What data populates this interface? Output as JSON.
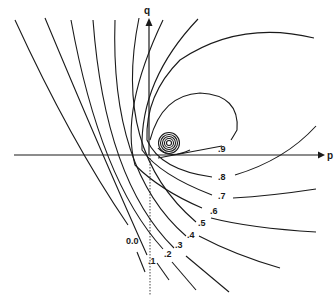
{
  "diagram": {
    "axes": {
      "x_label": "p",
      "y_label": "q"
    },
    "contour_labels": [
      "0.0",
      ".1",
      ".2",
      ".3",
      ".4",
      ".5",
      ".6",
      ".7",
      ".8",
      ".9"
    ],
    "colors": {
      "line": "#1a1a1a",
      "background": "#ffffff"
    }
  }
}
